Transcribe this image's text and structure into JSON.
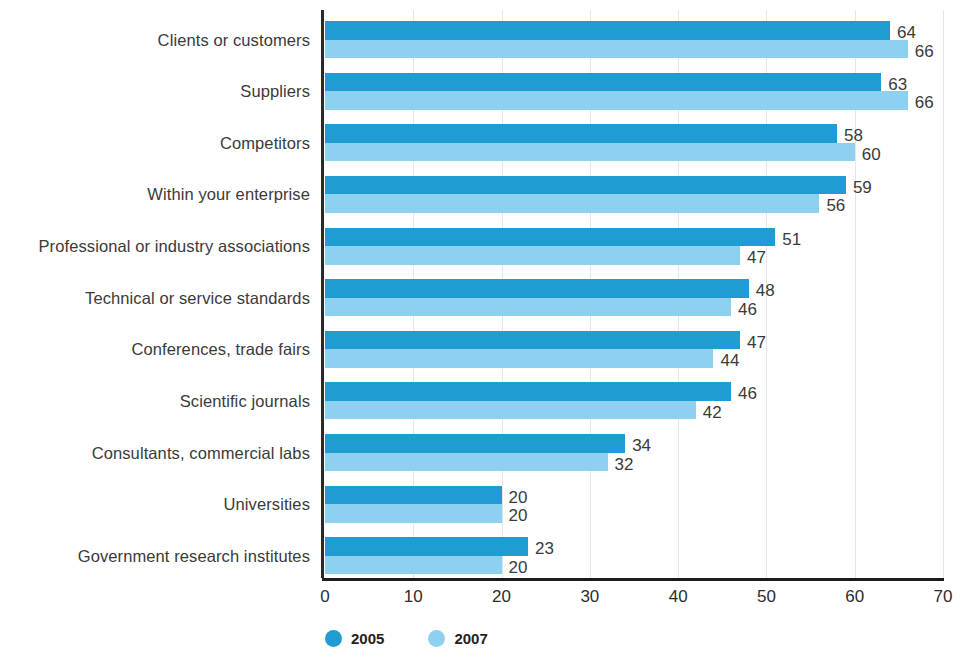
{
  "chart_data": {
    "type": "bar",
    "orientation": "horizontal",
    "title": "",
    "subtitle": "",
    "xlabel": "",
    "ylabel": "",
    "xlim": [
      0,
      70
    ],
    "xticks": [
      0,
      10,
      20,
      30,
      40,
      50,
      60,
      70
    ],
    "xtick_labels": [
      "0",
      "10",
      "20",
      "30",
      "40",
      "50",
      "60",
      "70"
    ],
    "grid": true,
    "grid_axis": "x",
    "legend_position": "bottom-left",
    "categories": [
      "Clients or customers",
      "Suppliers",
      "Competitors",
      "Within your enterprise",
      "Professional or industry associations",
      "Technical or service standards",
      "Conferences, trade fairs",
      "Scientific journals",
      "Consultants, commercial labs",
      "Universities",
      "Government research institutes"
    ],
    "series": [
      {
        "name": "2005",
        "color": "#1f9dd2",
        "values": [
          64,
          63,
          58,
          59,
          51,
          48,
          47,
          46,
          34,
          20,
          23
        ],
        "labels": [
          "64",
          "63",
          "58",
          "59",
          "51",
          "48",
          "47",
          "46",
          "34",
          "20",
          "23"
        ]
      },
      {
        "name": "2007",
        "color": "#8ed0f0",
        "values": [
          66,
          66,
          60,
          56,
          47,
          46,
          44,
          42,
          32,
          20,
          20
        ],
        "labels": [
          "66",
          "66",
          "60",
          "56",
          "47",
          "46",
          "44",
          "42",
          "32",
          "20",
          "20"
        ]
      }
    ]
  },
  "legend": {
    "items": [
      {
        "label": "2005",
        "color": "#1f9dd2"
      },
      {
        "label": "2007",
        "color": "#8ed0f0"
      }
    ]
  },
  "colors": {
    "series_2005": "#1f9dd2",
    "series_2007": "#8ed0f0",
    "axis": "#1d1d1d",
    "gridline": "#e6e6e6",
    "text": "#3a3a3a",
    "background": "#ffffff"
  }
}
